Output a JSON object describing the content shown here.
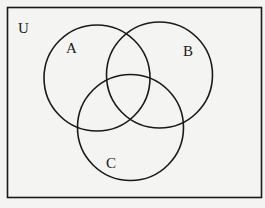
{
  "diagram": {
    "type": "venn",
    "universe_label": "U",
    "sets": [
      {
        "label": "A",
        "cx": 97,
        "cy": 78,
        "r": 53,
        "label_x": 66,
        "label_y": 53
      },
      {
        "label": "B",
        "cx": 159.5,
        "cy": 75,
        "r": 53,
        "label_x": 183,
        "label_y": 56
      },
      {
        "label": "C",
        "cx": 130.5,
        "cy": 127.5,
        "r": 53,
        "label_x": 106,
        "label_y": 168
      }
    ],
    "stroke_color": "#1a1a1a",
    "background": "#f4f4f2"
  }
}
